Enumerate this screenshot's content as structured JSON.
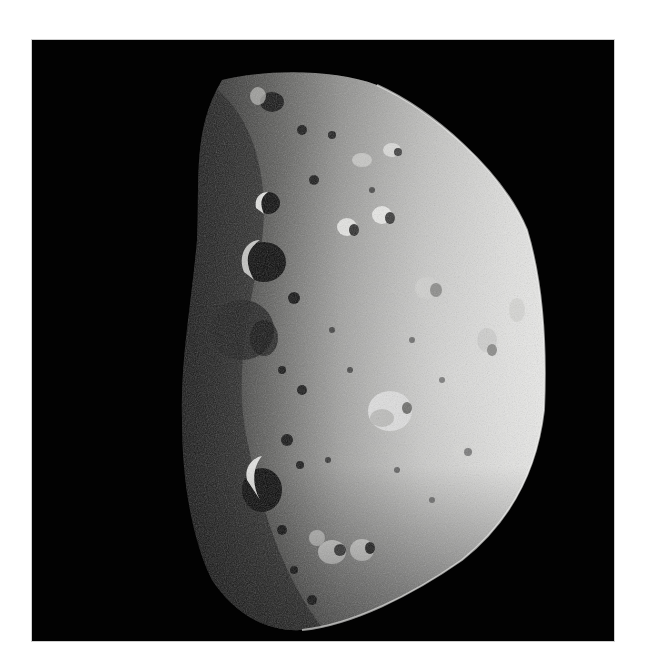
{
  "image": {
    "subject": "asteroid",
    "description": "Cratered asteroid, half-lit from the right against black space",
    "background_color": "#ffffff",
    "space_color": "#020202",
    "surface_light": "#e6e6e4",
    "surface_mid": "#9a9a98",
    "surface_dark": "#2a2a2a"
  }
}
